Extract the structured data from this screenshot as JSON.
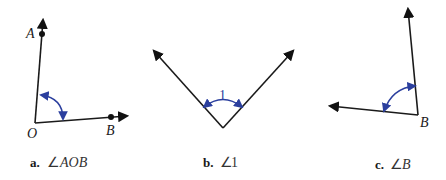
{
  "figures": [
    {
      "id": "a",
      "caption_letter": "a.",
      "caption_symbol": "∠",
      "caption_name": "AOB",
      "points": {
        "vertex": "O",
        "ray1_point": "A",
        "ray2_point": "B"
      },
      "arc_label": ""
    },
    {
      "id": "b",
      "caption_letter": "b.",
      "caption_symbol": "∠",
      "caption_name": "1",
      "points": {},
      "arc_label": "1"
    },
    {
      "id": "c",
      "caption_letter": "c.",
      "caption_symbol": "∠",
      "caption_name": "B",
      "points": {
        "vertex": "B"
      },
      "arc_label": ""
    }
  ],
  "colors": {
    "line": "#1a1a1a",
    "arc": "#2b3f9e",
    "background": "#ffffff"
  }
}
